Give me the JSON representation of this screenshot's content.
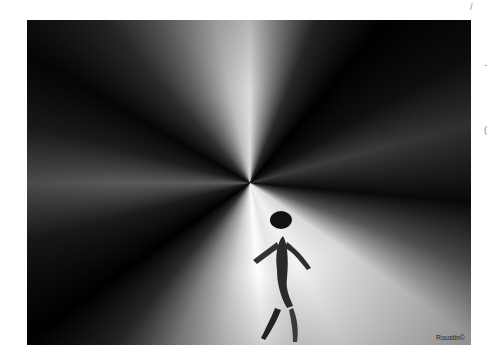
{
  "image": {
    "description": "Abstract black and white radial light burst with a dark silhouetted figure",
    "watermark": "Roustin©"
  },
  "margin_marks": {
    "top_right": "/",
    "right_upper": "-",
    "right_middle": "("
  }
}
